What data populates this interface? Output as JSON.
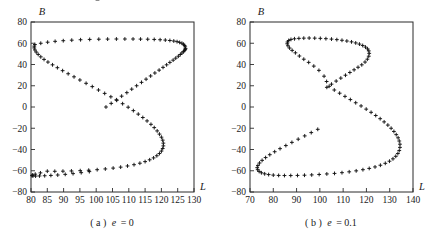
{
  "figure": {
    "background": "#ffffff",
    "marker_color": "#111111",
    "axis_color": "#2b2b2b",
    "marker_symbol": "+"
  },
  "panels": [
    {
      "id": "a",
      "caption_prefix": "( a )",
      "caption_symbol": "e",
      "caption_value": "= 0",
      "caption_full": "( a ) e = 0",
      "xlabel": "L",
      "ylabel": "B",
      "xticks": [
        80,
        85,
        90,
        95,
        100,
        105,
        110,
        115,
        120,
        125,
        130
      ],
      "yticks": [
        -80,
        -60,
        -40,
        -20,
        0,
        20,
        40,
        60,
        80
      ],
      "xlim": [
        80,
        130
      ],
      "ylim": [
        -80,
        80
      ]
    },
    {
      "id": "b",
      "caption_prefix": "( b )",
      "caption_symbol": "e",
      "caption_value": "= 0.1",
      "caption_full": "( b ) e = 0.1",
      "xlabel": "L",
      "ylabel": "B",
      "xticks": [
        70,
        80,
        90,
        100,
        110,
        120,
        130,
        140
      ],
      "yticks": [
        -80,
        -60,
        -40,
        -20,
        0,
        20,
        40,
        60,
        80
      ],
      "xlim": [
        70,
        140
      ],
      "ylim": [
        -80,
        80
      ]
    }
  ],
  "chart_data": [
    {
      "type": "scatter",
      "title": "( a ) e = 0",
      "xlabel": "L",
      "ylabel": "B",
      "xlim": [
        80,
        130
      ],
      "ylim": [
        -80,
        80
      ],
      "grid": false,
      "legend": "none",
      "series": [
        {
          "name": "ground-track-e0",
          "marker": "+",
          "x": [
            103.0,
            104.6,
            106.2,
            107.8,
            109.4,
            110.9,
            112.4,
            113.9,
            115.3,
            116.7,
            118.0,
            119.3,
            120.5,
            121.6,
            122.6,
            123.6,
            124.4,
            125.2,
            125.8,
            126.3,
            126.8,
            127.1,
            127.3,
            127.4,
            127.3,
            127.1,
            126.8,
            126.3,
            125.6,
            124.8,
            123.8,
            122.6,
            121.2,
            119.6,
            117.8,
            115.8,
            113.6,
            111.3,
            108.8,
            106.2,
            103.5,
            100.8,
            98.0,
            95.2,
            92.5,
            89.9,
            87.4,
            85.1,
            83.0,
            81.2,
            81.0,
            81.0,
            81.2,
            81.6,
            82.2,
            83.0,
            84.0,
            85.2,
            86.6,
            88.1,
            89.7,
            91.4,
            93.2,
            95.0,
            96.9,
            98.8,
            100.7,
            102.6,
            104.5,
            106.3,
            108.1,
            109.8,
            111.4,
            112.9,
            114.3,
            115.6,
            116.8,
            117.8,
            118.7,
            119.4,
            120.0,
            120.4,
            120.6,
            120.6,
            120.4,
            120.0,
            119.4,
            118.6,
            117.6,
            116.4,
            115.0,
            113.4,
            111.6,
            109.6,
            107.5,
            105.2,
            102.8,
            100.3,
            97.7,
            95.1,
            92.4,
            89.8,
            87.3,
            85.0,
            82.9,
            81.3,
            80.5,
            80.3,
            80.6,
            81.4,
            82.6,
            84.2,
            86.1,
            88.2,
            90.5,
            92.9,
            95.4,
            97.9,
            100.4
          ],
          "y": [
            0.0,
            3.4,
            6.8,
            10.2,
            13.5,
            16.8,
            20.0,
            23.2,
            26.2,
            29.2,
            32.0,
            34.7,
            37.3,
            39.7,
            42.0,
            44.1,
            46.0,
            47.8,
            49.4,
            50.8,
            52.1,
            53.2,
            54.2,
            55.0,
            56.6,
            57.9,
            59.0,
            60.0,
            60.8,
            61.5,
            62.1,
            62.6,
            63.0,
            63.3,
            63.6,
            63.8,
            63.9,
            64.0,
            64.0,
            64.0,
            63.9,
            63.8,
            63.6,
            63.3,
            62.9,
            62.4,
            61.8,
            61.0,
            60.0,
            58.8,
            57.3,
            55.6,
            53.7,
            51.7,
            49.5,
            47.2,
            44.8,
            42.3,
            39.7,
            37.0,
            34.2,
            31.3,
            28.4,
            25.4,
            22.3,
            19.2,
            16.0,
            12.8,
            9.6,
            6.3,
            3.1,
            -0.2,
            -3.4,
            -6.7,
            -9.9,
            -13.1,
            -16.3,
            -19.4,
            -22.5,
            -25.5,
            -28.4,
            -31.2,
            -34.0,
            -36.6,
            -39.1,
            -41.5,
            -43.8,
            -45.9,
            -47.9,
            -49.7,
            -51.4,
            -52.9,
            -54.3,
            -55.5,
            -56.6,
            -57.5,
            -58.3,
            -59.0,
            -59.5,
            -59.9,
            -60.2,
            -60.4,
            -60.5,
            -60.4,
            -62.0,
            -63.2,
            -64.0,
            -64.6,
            -64.9,
            -65.0,
            -64.9,
            -64.7,
            -64.4,
            -64.0,
            -63.4,
            -62.7,
            -61.8,
            -60.8
          ]
        }
      ]
    },
    {
      "type": "scatter",
      "title": "( b ) e = 0.1",
      "xlabel": "L",
      "ylabel": "B",
      "xlim": [
        70,
        140
      ],
      "ylim": [
        -80,
        80
      ],
      "grid": false,
      "legend": "none",
      "series": [
        {
          "name": "ground-track-e01",
          "marker": "+",
          "x": [
            103.0,
            105.0,
            107.0,
            109.0,
            111.0,
            112.9,
            114.7,
            116.4,
            118.0,
            119.4,
            120.4,
            121.0,
            121.2,
            121.0,
            120.5,
            119.6,
            118.4,
            117.0,
            115.4,
            113.6,
            111.6,
            109.5,
            107.3,
            105.0,
            102.6,
            100.2,
            97.8,
            95.4,
            93.1,
            91.0,
            89.1,
            87.6,
            86.6,
            86.1,
            86.0,
            86.3,
            87.0,
            88.1,
            89.5,
            91.2,
            93.1,
            95.2,
            97.4,
            99.6,
            101.8,
            102.9,
            104.0,
            106.2,
            108.5,
            110.8,
            113.1,
            115.4,
            117.7,
            119.9,
            122.0,
            124.0,
            125.9,
            127.6,
            129.2,
            130.6,
            131.8,
            132.8,
            133.6,
            134.1,
            134.4,
            134.4,
            134.1,
            133.5,
            132.6,
            131.4,
            129.9,
            128.1,
            126.0,
            123.7,
            121.2,
            118.5,
            115.6,
            112.6,
            109.5,
            106.3,
            103.0,
            99.7,
            96.5,
            93.4,
            90.4,
            87.5,
            84.8,
            82.3,
            80.0,
            78.0,
            76.3,
            74.9,
            73.9,
            73.3,
            73.1,
            73.4,
            74.1,
            75.2,
            76.7,
            78.5,
            80.6,
            82.9,
            85.4,
            88.0,
            90.7,
            93.5,
            96.3,
            99.1
          ],
          "y": [
            18.5,
            21.5,
            24.4,
            27.2,
            29.9,
            32.5,
            35.0,
            37.4,
            39.7,
            42.3,
            45.0,
            47.8,
            50.5,
            52.8,
            54.7,
            56.4,
            57.9,
            59.2,
            60.3,
            61.3,
            62.1,
            62.8,
            63.4,
            63.9,
            64.3,
            64.6,
            64.8,
            64.9,
            64.8,
            64.6,
            64.2,
            63.6,
            62.6,
            61.2,
            59.5,
            57.6,
            55.5,
            53.3,
            51.0,
            48.0,
            45.0,
            42.0,
            38.5,
            34.5,
            29.0,
            24.0,
            19.5,
            16.0,
            13.0,
            10.0,
            7.0,
            4.0,
            1.0,
            -2.0,
            -5.0,
            -8.0,
            -11.0,
            -14.0,
            -17.0,
            -20.0,
            -23.0,
            -26.0,
            -29.0,
            -32.0,
            -35.0,
            -38.0,
            -41.0,
            -43.8,
            -46.4,
            -48.8,
            -51.0,
            -53.0,
            -54.8,
            -56.4,
            -57.8,
            -59.0,
            -60.1,
            -61.0,
            -61.8,
            -62.5,
            -63.0,
            -63.5,
            -63.9,
            -64.2,
            -64.4,
            -64.5,
            -64.5,
            -64.4,
            -64.1,
            -63.6,
            -62.9,
            -61.9,
            -60.6,
            -59.0,
            -57.1,
            -55.0,
            -52.7,
            -50.2,
            -47.6,
            -44.9,
            -42.1,
            -39.2,
            -36.3,
            -33.3,
            -30.3,
            -27.2,
            -24.1,
            -21.0
          ]
        }
      ]
    }
  ]
}
